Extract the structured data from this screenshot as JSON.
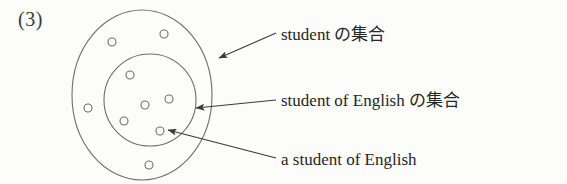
{
  "figure": {
    "index_label": "(3)"
  },
  "callouts": [
    {
      "id": "outer-set",
      "text": "student の集合",
      "points_to": "outer-circle"
    },
    {
      "id": "inner-set",
      "text": "student of English の集合",
      "points_to": "inner-circle"
    },
    {
      "id": "element",
      "text": "a student of English",
      "points_to": "inner-element-dot"
    }
  ],
  "diagram": {
    "stroke_color": "#6b6b6b",
    "fill_color": "none",
    "outer_circle": {
      "cx": 142,
      "cy": 95,
      "rx": 70,
      "ry": 85
    },
    "inner_circle": {
      "cx": 150,
      "cy": 100,
      "rx": 46,
      "ry": 46
    },
    "annulus_dots": [
      {
        "cx": 112,
        "cy": 42,
        "r": 4
      },
      {
        "cx": 164,
        "cy": 34,
        "r": 4
      },
      {
        "cx": 88,
        "cy": 108,
        "r": 4
      },
      {
        "cx": 149,
        "cy": 165,
        "r": 4
      }
    ],
    "inner_dots": [
      {
        "cx": 130,
        "cy": 75,
        "r": 4
      },
      {
        "cx": 145,
        "cy": 105,
        "r": 4
      },
      {
        "cx": 169,
        "cy": 99,
        "r": 4
      },
      {
        "cx": 124,
        "cy": 121,
        "r": 4
      },
      {
        "cx": 160,
        "cy": 131,
        "r": 4
      }
    ],
    "arrows": [
      {
        "id": "arrow-outer-set",
        "x1": 276,
        "y1": 33,
        "x2": 219,
        "y2": 58
      },
      {
        "id": "arrow-inner-set",
        "x1": 276,
        "y1": 100,
        "x2": 196,
        "y2": 108
      },
      {
        "id": "arrow-element",
        "x1": 276,
        "y1": 158,
        "x2": 168,
        "y2": 130
      }
    ]
  }
}
